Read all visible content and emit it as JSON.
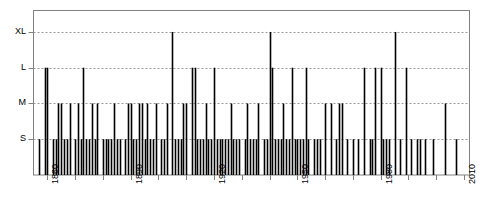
{
  "chart_data": {
    "type": "bar",
    "title": "",
    "subtitle": "",
    "xlabel": "",
    "ylabel": "",
    "grid": true,
    "legend": null,
    "orientation": "vertical",
    "style": "impulse/spike plot of event size by year",
    "xlim": [
      1855,
      2012
    ],
    "ylim": [
      0,
      4.6
    ],
    "x_major_ticks": [
      1860,
      1890,
      1920,
      1950,
      1980,
      2010
    ],
    "x_major_tick_labels": [
      "1860",
      "1890",
      "1920",
      "1950",
      "1980",
      "2010"
    ],
    "x_minor_tick_interval": 10,
    "x_minor_ticks": [
      1860,
      1870,
      1880,
      1890,
      1900,
      1910,
      1920,
      1930,
      1940,
      1950,
      1960,
      1970,
      1980,
      1990,
      2000,
      2010
    ],
    "y_categories": [
      "S",
      "M",
      "L",
      "XL"
    ],
    "y_tick_labels": [
      "S",
      "M",
      "L",
      "XL"
    ],
    "y_tick_values": [
      1,
      2,
      3,
      4
    ],
    "bar_color": "#000000",
    "grid_color": "#999999",
    "axis_color": "#808080",
    "categories": [
      1857,
      1859,
      1860,
      1862,
      1863,
      1864,
      1865,
      1866,
      1867,
      1868,
      1870,
      1871,
      1872,
      1873,
      1874,
      1875,
      1876,
      1877,
      1878,
      1880,
      1881,
      1882,
      1883,
      1884,
      1885,
      1886,
      1888,
      1889,
      1890,
      1891,
      1892,
      1893,
      1894,
      1895,
      1896,
      1897,
      1898,
      1899,
      1901,
      1902,
      1903,
      1905,
      1906,
      1907,
      1908,
      1909,
      1910,
      1912,
      1913,
      1914,
      1915,
      1916,
      1917,
      1918,
      1919,
      1920,
      1921,
      1922,
      1923,
      1924,
      1925,
      1926,
      1927,
      1928,
      1929,
      1931,
      1932,
      1933,
      1934,
      1935,
      1936,
      1938,
      1939,
      1940,
      1941,
      1942,
      1943,
      1944,
      1945,
      1946,
      1947,
      1948,
      1949,
      1950,
      1951,
      1952,
      1953,
      1954,
      1956,
      1957,
      1958,
      1960,
      1962,
      1964,
      1965,
      1966,
      1968,
      1970,
      1972,
      1974,
      1976,
      1977,
      1978,
      1980,
      1981,
      1982,
      1983,
      1985,
      1987,
      1989,
      1991,
      1993,
      1994,
      1996,
      1999,
      2003,
      2007
    ],
    "values": [
      1,
      3,
      3,
      1,
      1,
      2,
      2,
      1,
      1,
      2,
      1,
      2,
      1,
      3,
      1,
      1,
      2,
      1,
      2,
      1,
      1,
      1,
      1,
      2,
      1,
      1,
      1,
      2,
      2,
      1,
      1,
      2,
      2,
      1,
      2,
      1,
      1,
      2,
      1,
      1,
      2,
      4,
      1,
      1,
      1,
      2,
      2,
      3,
      3,
      1,
      1,
      1,
      2,
      1,
      1,
      3,
      1,
      1,
      1,
      1,
      1,
      2,
      1,
      1,
      1,
      1,
      2,
      1,
      1,
      1,
      2,
      1,
      1,
      4,
      3,
      1,
      1,
      1,
      2,
      1,
      1,
      3,
      1,
      1,
      1,
      1,
      3,
      1,
      1,
      1,
      1,
      2,
      2,
      1,
      2,
      2,
      1,
      1,
      1,
      3,
      1,
      1,
      3,
      3,
      1,
      1,
      1,
      4,
      1,
      3,
      1,
      1,
      1,
      1,
      1,
      2,
      1
    ]
  }
}
